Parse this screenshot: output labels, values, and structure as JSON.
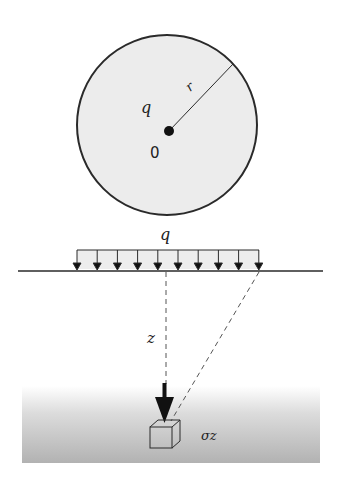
{
  "diagram": {
    "plan_view": {
      "load_label": "q",
      "center_label": "0",
      "radius_label": "r"
    },
    "section_view": {
      "load_label": "q",
      "depth_label": "z",
      "stress_label": "σz",
      "arrow_count": 10
    },
    "colors": {
      "stroke": "#2a2a2a",
      "circle_fill": "#ececec",
      "load_fill": "#ededed",
      "soil_top": "#ffffff",
      "soil_bottom": "#b4b4b4"
    }
  }
}
